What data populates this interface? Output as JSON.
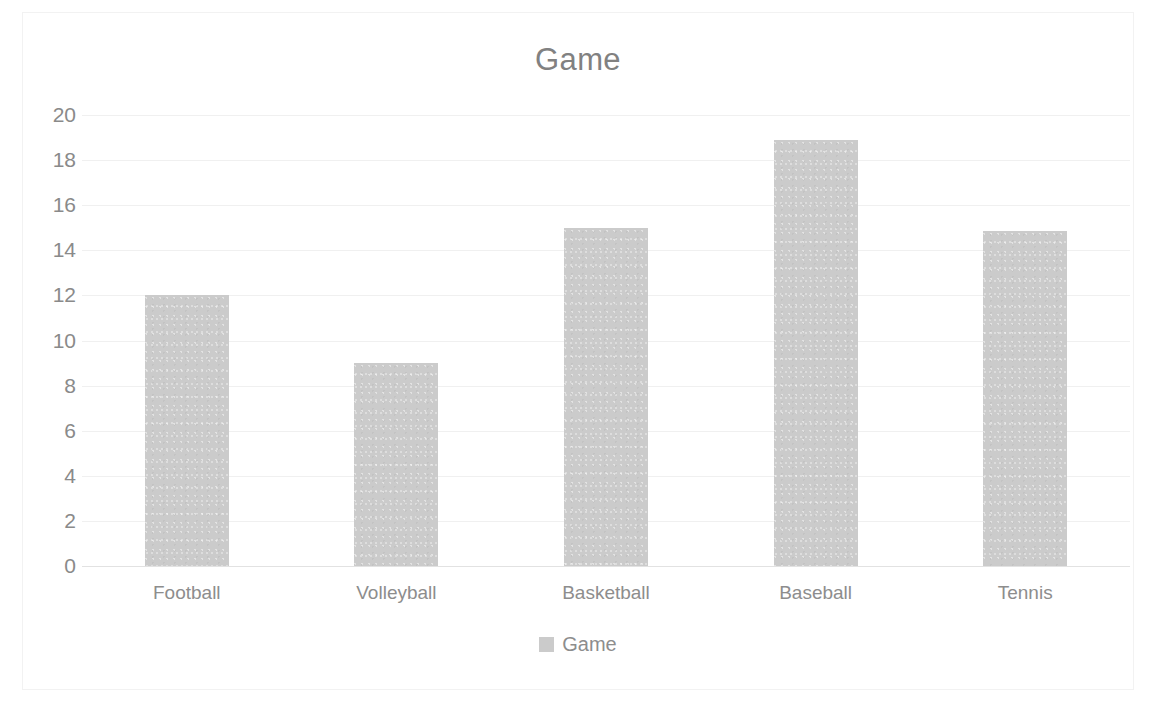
{
  "chart_data": {
    "type": "bar",
    "title": "Game",
    "xlabel": "",
    "ylabel": "",
    "categories": [
      "Football",
      "Volleyball",
      "Basketball",
      "Baseball",
      "Tennis"
    ],
    "values": [
      12,
      9,
      15,
      18.9,
      14.85
    ],
    "series": [
      {
        "name": "Game",
        "values": [
          12,
          9,
          15,
          18.9,
          14.85
        ]
      }
    ],
    "ylim": [
      0,
      20
    ],
    "ytick_step": 2,
    "yticks": [
      20,
      18,
      16,
      14,
      12,
      10,
      8,
      6,
      4,
      2,
      0
    ],
    "grid": true,
    "grid_axis": "y",
    "legend": {
      "position": "bottom",
      "entries": [
        "Game"
      ]
    },
    "colors": {
      "bar": "#cbcbcb",
      "title": "#818181",
      "tick_label": "#8a8a8a",
      "gridline": "#f0f0f0",
      "baseline": "#e2e2e2",
      "frame": "#f2f2f2",
      "background": "#ffffff"
    }
  }
}
